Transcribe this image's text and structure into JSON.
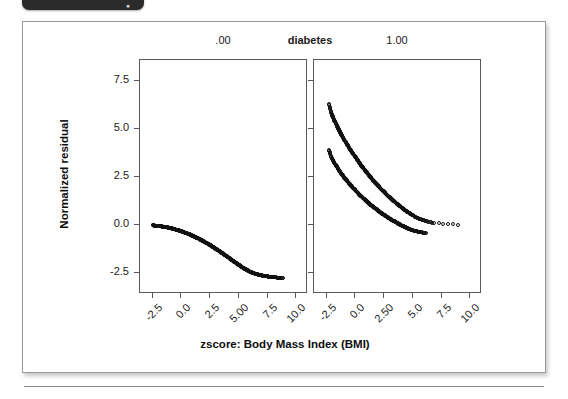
{
  "window": {
    "tab_glyph": "●"
  },
  "chart_data": {
    "type": "scatter",
    "title": "",
    "xlabel": "zscore: Body Mass Index (BMI)",
    "ylabel": "Normalized residual",
    "grid": false,
    "legend": "none",
    "facet_variable": "diabetes",
    "facet_header_center": "diabetes",
    "panels": [
      {
        "name": ".00",
        "header": ".00",
        "xlim": [
          -3.6,
          11.0
        ],
        "ylim": [
          -3.6,
          8.6
        ],
        "xticks": [
          -2.5,
          0.0,
          2.5,
          5.0,
          7.5,
          10.0
        ],
        "xticklabels": [
          "-2.5",
          "0.0",
          "2.5",
          "5.00",
          "7.5",
          "10.0"
        ],
        "yticks": [
          -2.5,
          0.0,
          2.5,
          5.0,
          7.5
        ],
        "yticklabels": [
          "-2.5",
          "0.0",
          "2.5",
          "5.0",
          "7.5"
        ],
        "series": [
          {
            "name": "band",
            "marker": "open-circle",
            "x": [
              -2.5,
              -2.35,
              -2.2,
              -2.05,
              -1.9,
              -1.75,
              -1.6,
              -1.45,
              -1.3,
              -1.15,
              -1.0,
              -0.85,
              -0.7,
              -0.55,
              -0.4,
              -0.25,
              -0.1,
              0.05,
              0.2,
              0.35,
              0.5,
              0.65,
              0.8,
              0.95,
              1.1,
              1.25,
              1.4,
              1.55,
              1.7,
              1.85,
              2.0,
              2.15,
              2.3,
              2.45,
              2.6,
              2.75,
              2.9,
              3.05,
              3.2,
              3.35,
              3.5,
              3.65,
              3.8,
              3.95,
              4.1,
              4.25,
              4.4,
              4.55,
              4.7,
              4.85,
              5.0,
              5.15,
              5.3,
              5.45,
              5.6,
              5.75,
              5.9,
              6.05,
              6.2,
              6.35,
              6.5,
              6.7,
              6.9,
              7.1,
              7.3,
              7.55,
              7.8,
              8.1,
              8.45,
              8.8
            ],
            "y": [
              -0.02,
              -0.03,
              -0.04,
              -0.05,
              -0.06,
              -0.07,
              -0.09,
              -0.1,
              -0.12,
              -0.14,
              -0.16,
              -0.18,
              -0.2,
              -0.23,
              -0.25,
              -0.28,
              -0.31,
              -0.34,
              -0.37,
              -0.41,
              -0.44,
              -0.48,
              -0.52,
              -0.56,
              -0.6,
              -0.64,
              -0.69,
              -0.73,
              -0.78,
              -0.83,
              -0.88,
              -0.93,
              -0.98,
              -1.04,
              -1.09,
              -1.15,
              -1.21,
              -1.27,
              -1.33,
              -1.39,
              -1.45,
              -1.51,
              -1.58,
              -1.64,
              -1.71,
              -1.77,
              -1.84,
              -1.9,
              -1.97,
              -2.03,
              -2.09,
              -2.15,
              -2.21,
              -2.27,
              -2.32,
              -2.37,
              -2.42,
              -2.46,
              -2.5,
              -2.53,
              -2.56,
              -2.59,
              -2.62,
              -2.65,
              -2.67,
              -2.69,
              -2.71,
              -2.73,
              -2.75,
              -2.77
            ]
          }
        ]
      },
      {
        "name": "1.00",
        "header": "1.00",
        "xlim": [
          -3.6,
          11.0
        ],
        "ylim": [
          -3.6,
          8.6
        ],
        "xticks": [
          -2.5,
          0.0,
          2.5,
          5.0,
          7.5,
          10.0
        ],
        "xticklabels": [
          "-2.5",
          "0.0",
          "2.50",
          "5.0",
          "7.5",
          "10.0"
        ],
        "yticks": [
          -2.5,
          0.0,
          2.5,
          5.0,
          7.5
        ],
        "yticklabels": [
          "-2.5",
          "0.0",
          "2.5",
          "5.0",
          "7.5"
        ],
        "series": [
          {
            "name": "upper-branch",
            "marker": "open-circle",
            "x": [
              -2.3,
              -2.15,
              -2.0,
              -1.85,
              -1.7,
              -1.55,
              -1.4,
              -1.25,
              -1.1,
              -0.95,
              -0.8,
              -0.65,
              -0.5,
              -0.35,
              -0.2,
              -0.05,
              0.1,
              0.25,
              0.4,
              0.55,
              0.7,
              0.85,
              1.0,
              1.15,
              1.3,
              1.45,
              1.6,
              1.75,
              1.9,
              2.05,
              2.2,
              2.35,
              2.5,
              2.65,
              2.8,
              2.95,
              3.1,
              3.25,
              3.4,
              3.55,
              3.7,
              3.85,
              4.0,
              4.2,
              4.4,
              4.6,
              4.85,
              5.1,
              5.4,
              5.75,
              6.2,
              6.8,
              8.9
            ],
            "y": [
              6.3,
              5.95,
              5.7,
              5.48,
              5.28,
              5.09,
              4.91,
              4.74,
              4.58,
              4.42,
              4.27,
              4.12,
              3.98,
              3.84,
              3.7,
              3.57,
              3.44,
              3.31,
              3.19,
              3.07,
              2.95,
              2.83,
              2.72,
              2.61,
              2.5,
              2.39,
              2.29,
              2.19,
              2.09,
              1.99,
              1.89,
              1.8,
              1.71,
              1.62,
              1.53,
              1.45,
              1.37,
              1.29,
              1.21,
              1.13,
              1.06,
              0.99,
              0.92,
              0.82,
              0.73,
              0.65,
              0.55,
              0.46,
              0.36,
              0.27,
              0.18,
              0.1,
              0.02
            ]
          },
          {
            "name": "lower-branch",
            "marker": "open-circle",
            "x": [
              -2.3,
              -2.15,
              -2.0,
              -1.85,
              -1.7,
              -1.55,
              -1.4,
              -1.25,
              -1.1,
              -0.95,
              -0.8,
              -0.65,
              -0.5,
              -0.35,
              -0.2,
              -0.05,
              0.1,
              0.25,
              0.4,
              0.55,
              0.7,
              0.85,
              1.0,
              1.15,
              1.3,
              1.45,
              1.6,
              1.75,
              1.9,
              2.05,
              2.2,
              2.35,
              2.5,
              2.65,
              2.8,
              2.95,
              3.1,
              3.25,
              3.4,
              3.55,
              3.7,
              3.85,
              4.0,
              4.2,
              4.4,
              4.6,
              4.85,
              5.1,
              5.4,
              5.75,
              6.15
            ],
            "y": [
              3.9,
              3.62,
              3.43,
              3.26,
              3.11,
              2.97,
              2.83,
              2.7,
              2.58,
              2.46,
              2.35,
              2.24,
              2.13,
              2.03,
              1.93,
              1.83,
              1.74,
              1.64,
              1.55,
              1.47,
              1.38,
              1.3,
              1.22,
              1.14,
              1.06,
              0.99,
              0.92,
              0.85,
              0.78,
              0.71,
              0.64,
              0.58,
              0.52,
              0.46,
              0.4,
              0.34,
              0.29,
              0.23,
              0.18,
              0.13,
              0.08,
              0.03,
              -0.02,
              -0.08,
              -0.14,
              -0.19,
              -0.25,
              -0.3,
              -0.35,
              -0.39,
              -0.43
            ]
          }
        ]
      }
    ]
  }
}
